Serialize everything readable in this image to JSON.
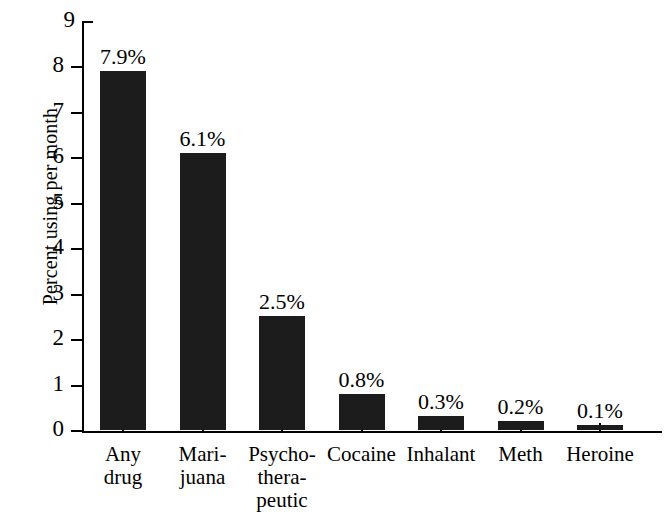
{
  "chart_data": {
    "type": "bar",
    "title": "",
    "subtitle": "",
    "xlabel": "",
    "ylabel": "Percent using per month",
    "ylim": [
      0,
      9
    ],
    "ytick_labels": [
      "0",
      "1",
      "2",
      "3",
      "4",
      "5",
      "6",
      "7",
      "8",
      "9"
    ],
    "ytick_values": [
      0,
      1,
      2,
      3,
      4,
      5,
      6,
      7,
      8,
      9
    ],
    "grid": false,
    "legend": false,
    "bar_color": "#1c1c1c",
    "categories": [
      "Any\ndrug",
      "Mari-\njuana",
      "Psycho-\nthera-\npeutic",
      "Cocaine",
      "Inhalant",
      "Meth",
      "Heroine"
    ],
    "values": [
      7.9,
      6.1,
      2.5,
      0.8,
      0.3,
      0.2,
      0.1
    ],
    "value_labels": [
      "7.9%",
      "6.1%",
      "2.5%",
      "0.8%",
      "0.3%",
      "0.2%",
      "0.1%"
    ]
  }
}
